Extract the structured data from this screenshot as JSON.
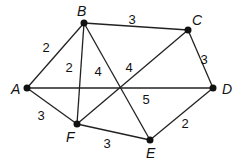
{
  "graph": {
    "nodes": [
      {
        "id": "A",
        "x": 27,
        "y": 88,
        "lx": 11,
        "ly": 94
      },
      {
        "id": "B",
        "x": 84,
        "y": 23,
        "lx": 77,
        "ly": 16
      },
      {
        "id": "C",
        "x": 188,
        "y": 30,
        "lx": 192,
        "ly": 25
      },
      {
        "id": "D",
        "x": 213,
        "y": 88,
        "lx": 222,
        "ly": 94
      },
      {
        "id": "E",
        "x": 150,
        "y": 140,
        "lx": 146,
        "ly": 158
      },
      {
        "id": "F",
        "x": 77,
        "y": 124,
        "lx": 66,
        "ly": 142
      }
    ],
    "edges": [
      {
        "from": "A",
        "to": "B",
        "weight": "2",
        "wx": 46,
        "wy": 52
      },
      {
        "from": "B",
        "to": "C",
        "weight": "3",
        "wx": 132,
        "wy": 24
      },
      {
        "from": "C",
        "to": "D",
        "weight": "3",
        "wx": 204,
        "wy": 64
      },
      {
        "from": "D",
        "to": "E",
        "weight": "2",
        "wx": 185,
        "wy": 128
      },
      {
        "from": "E",
        "to": "F",
        "weight": "3",
        "wx": 107,
        "wy": 148
      },
      {
        "from": "F",
        "to": "A",
        "weight": "3",
        "wx": 41,
        "wy": 120
      },
      {
        "from": "B",
        "to": "F",
        "weight": "2",
        "wx": 69,
        "wy": 72
      },
      {
        "from": "B",
        "to": "E",
        "weight": "4",
        "wx": 98,
        "wy": 76
      },
      {
        "from": "F",
        "to": "C",
        "weight": "4",
        "wx": 129,
        "wy": 72
      },
      {
        "from": "A",
        "to": "D",
        "weight": "5",
        "wx": 146,
        "wy": 104
      }
    ]
  }
}
